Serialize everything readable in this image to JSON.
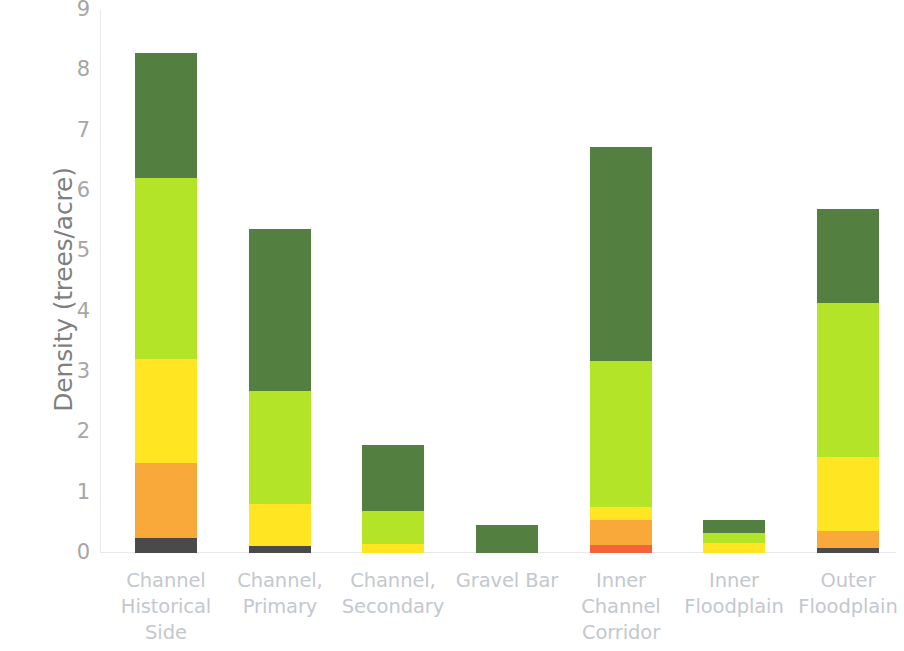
{
  "chart_data": {
    "type": "bar",
    "subtype": "stacked-bar",
    "title": "",
    "xlabel": "",
    "ylabel": "Density (trees/acre)",
    "ylim": [
      0,
      9
    ],
    "yticks": [
      "0",
      "1",
      "2",
      "3",
      "4",
      "5",
      "6",
      "7",
      "8",
      "9"
    ],
    "grid": false,
    "legend": "none",
    "categories": [
      "Channel\nHistorical\nSide",
      "Channel,\nPrimary",
      "Channel,\nSecondary",
      "Gravel Bar",
      "Inner\nChannel\nCorridor",
      "Inner\nFloodplain",
      "Outer\nFloodplain"
    ],
    "series": [
      {
        "name": "dark-gray-class",
        "color": "#4a4a4a",
        "values": [
          0.25,
          0.12,
          0.0,
          0.0,
          0.0,
          0.0,
          0.08
        ]
      },
      {
        "name": "red-class",
        "color": "#f4633a",
        "values": [
          0.0,
          0.0,
          0.0,
          0.0,
          0.13,
          0.0,
          0.0
        ]
      },
      {
        "name": "orange-class",
        "color": "#f9a93a",
        "values": [
          1.24,
          0.0,
          0.0,
          0.0,
          0.42,
          0.0,
          0.29
        ]
      },
      {
        "name": "yellow-class",
        "color": "#ffe522",
        "values": [
          1.73,
          0.7,
          0.15,
          0.0,
          0.22,
          0.17,
          1.22
        ]
      },
      {
        "name": "yellow-green-class",
        "color": "#b4e428",
        "values": [
          3.0,
          1.86,
          0.55,
          0.0,
          2.42,
          0.17,
          2.55
        ]
      },
      {
        "name": "dark-green-class",
        "color": "#537f41",
        "values": [
          2.07,
          2.69,
          1.09,
          0.47,
          3.54,
          0.21,
          1.56
        ]
      }
    ],
    "totals": [
      8.29,
      5.37,
      1.79,
      0.47,
      6.73,
      0.55,
      5.7
    ]
  },
  "axis": {
    "y_title": "Density (trees/acre)",
    "y_ticks": [
      "9",
      "8",
      "7",
      "6",
      "5",
      "4",
      "3",
      "2",
      "1",
      "0"
    ],
    "x_labels": [
      "Channel\nHistorical\nSide",
      "Channel,\nPrimary",
      "Channel,\nSecondary",
      "Gravel Bar",
      "Inner\nChannel\nCorridor",
      "Inner\nFloodplain",
      "Outer\nFloodplain"
    ]
  },
  "colors": {
    "dark_green": "#537f41",
    "yellow_green": "#b4e428",
    "yellow": "#ffe522",
    "orange": "#f9a93a",
    "red": "#f4633a",
    "dark_gray": "#4a4a4a",
    "axis_line": "#e8e8e8",
    "tick_text": "#a6a6a6",
    "x_label_text": "#c3c8ce",
    "y_title_text": "#7f7f7f",
    "background": "#ffffff"
  }
}
